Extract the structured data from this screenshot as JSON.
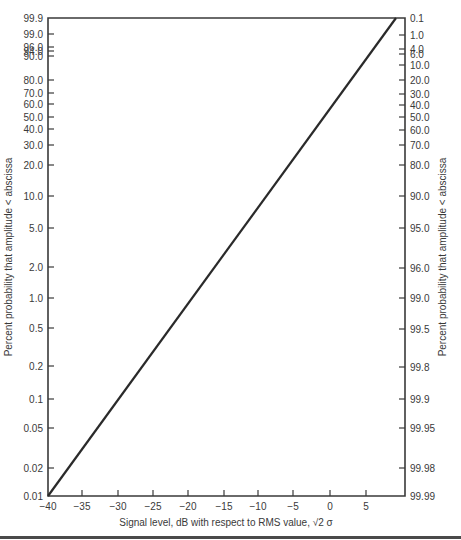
{
  "chart_data": {
    "type": "line",
    "title": "",
    "xlabel": "Signal level, dB with respect to RMS value, √2 σ",
    "ylabel_left": "Percent probability that amplitude < abscissa",
    "ylabel_right": "Percent probability that amplitude < abscissa",
    "xlim": [
      -40,
      10
    ],
    "x_ticks": [
      -40,
      -35,
      -30,
      -25,
      -20,
      -15,
      -10,
      -5,
      0,
      5
    ],
    "x_tick_labels": [
      "−40",
      "−35",
      "−30",
      "−25",
      "−20",
      "−15",
      "−10",
      "−5",
      "0",
      "5"
    ],
    "y_left_ticks": [
      "99.9",
      "99.0",
      "96.0",
      "94.0",
      "90.0",
      "80.0",
      "70.0",
      "60.0",
      "50.0",
      "40.0",
      "30.0",
      "20.0",
      "10.0",
      "5.0",
      "2.0",
      "1.0",
      "0.5",
      "0.2",
      "0.1",
      "0.05",
      "0.02",
      "0.01"
    ],
    "y_right_ticks": [
      "0.1",
      "1.0",
      "4.0",
      "6.0",
      "10.0",
      "20.0",
      "30.0",
      "40.0",
      "50.0",
      "60.0",
      "70.0",
      "80.0",
      "90.0",
      "95.0",
      "96.0",
      "99.0",
      "99.5",
      "99.8",
      "99.9",
      "99.95",
      "99.98",
      "99.99"
    ],
    "ylim_left": [
      0.01,
      99.9
    ],
    "ylim_right": [
      99.99,
      0.1
    ],
    "grid": false,
    "legend": null,
    "series": [
      {
        "name": "Cumulative amplitude probability",
        "x": [
          -40,
          8.5
        ],
        "y_left_percent": [
          0.01,
          99.9
        ]
      }
    ]
  },
  "layout": {
    "plot": {
      "left": 48,
      "right": 405,
      "top": 18,
      "bottom": 496
    },
    "x_tick_px": [
      48,
      82,
      118,
      153,
      188,
      224,
      258,
      293,
      330,
      366
    ],
    "y_left_tick_px": [
      18,
      34,
      47,
      51,
      56,
      80,
      93,
      104,
      117,
      129,
      145,
      165,
      196,
      228,
      267,
      298,
      328,
      366,
      399,
      428,
      468,
      496
    ],
    "y_right_tick_px": [
      18,
      35,
      49,
      54,
      65,
      80,
      94,
      105,
      117,
      130,
      145,
      165,
      196,
      228,
      268,
      298,
      329,
      367,
      399,
      428,
      468,
      496
    ],
    "line": {
      "x1": 48,
      "y1": 496,
      "x2": 396,
      "y2": 18
    },
    "colors": {
      "axis": "#3a3a3a",
      "line": "#2a2a2a",
      "text": "#3a3a3a"
    }
  }
}
